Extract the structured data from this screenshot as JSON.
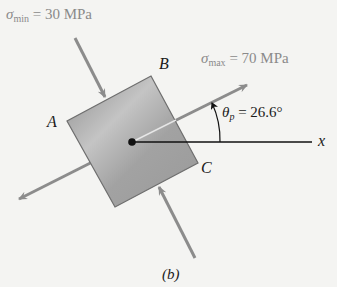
{
  "diagram": {
    "caption": "(b)",
    "sigma_min": {
      "symbol": "σ",
      "subscript": "min",
      "equals": " = ",
      "value": "30 MPa"
    },
    "sigma_max": {
      "symbol": "σ",
      "subscript": "max",
      "equals": " = ",
      "value": "70 MPa"
    },
    "theta_p": {
      "symbol": "θ",
      "subscript": "p",
      "equals": " = ",
      "value": "26.6°"
    },
    "corner_labels": {
      "a": "A",
      "b": "B",
      "c": "C"
    },
    "axis_label": "x",
    "colors": {
      "arrow": "#8c8c8c",
      "element_fill": "#a9a9a9",
      "element_edge": "#6e6e6e",
      "axis": "#111111",
      "background": "#f4f4f2"
    }
  }
}
